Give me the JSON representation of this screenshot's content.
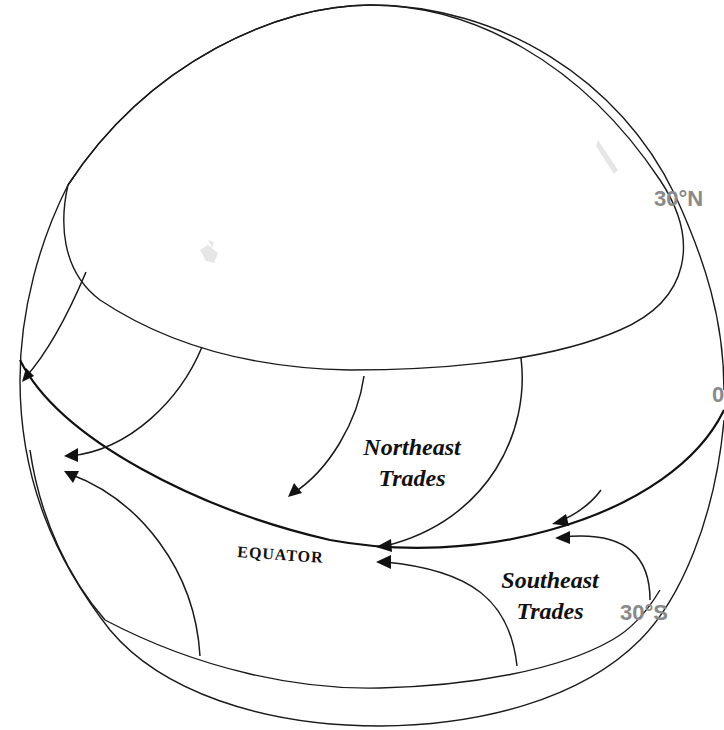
{
  "diagram": {
    "labels": {
      "northeast_trades_line1": "Northeast",
      "northeast_trades_line2": "Trades",
      "southeast_trades_line1": "Southeast",
      "southeast_trades_line2": "Trades",
      "equator": "EQUATOR",
      "lat_30n": "30°N",
      "lat_0": "0",
      "lat_30s": "30°S"
    },
    "colors": {
      "lines": "#1a1a1a",
      "latitude_labels": "#8a8a8a",
      "background": "#ffffff"
    },
    "arrows": {
      "northeast_trades_count": 5,
      "southeast_trades_count": 4,
      "direction": "westward toward equator"
    }
  }
}
